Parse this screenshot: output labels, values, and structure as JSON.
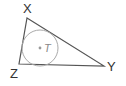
{
  "diagram": {
    "type": "triangle-with-incircle",
    "vertices": [
      {
        "label": "X",
        "x": 27,
        "y": 18
      },
      {
        "label": "Y",
        "x": 104,
        "y": 66
      },
      {
        "label": "Z",
        "x": 19,
        "y": 64
      }
    ],
    "incircle": {
      "center_label": "T",
      "cx": 40,
      "cy": 48,
      "r": 18
    },
    "colors": {
      "triangle_stroke": "#555555",
      "circle_stroke": "#aaaaaa",
      "center_dot": "#999999",
      "label": "#333333",
      "center_label": "#888888"
    }
  },
  "labels": {
    "x": "X",
    "y": "Y",
    "z": "Z",
    "t": "T"
  }
}
